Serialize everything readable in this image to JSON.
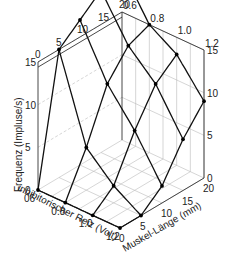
{
  "chart_data": {
    "type": "surface3d",
    "title": "",
    "axes": {
      "z": {
        "label": "Frequenz (Impluse/s)",
        "ticks": [
          0,
          5,
          10,
          15
        ],
        "range": [
          0,
          15
        ]
      },
      "x": {
        "label": "inhibitorischer Reiz (Volt)",
        "ticks": [
          "0.6",
          "0.8",
          "1.0",
          "1.2"
        ],
        "tick_labels": [
          "06",
          "0.8",
          "1.0",
          "1.2"
        ],
        "range": [
          0.6,
          1.2
        ]
      },
      "y": {
        "label": "Muskel-Länge (mm)",
        "ticks": [
          0,
          5,
          10,
          15,
          20
        ],
        "range": [
          0,
          20
        ]
      }
    },
    "back_tick_labels": {
      "top_left_edge": [
        "0",
        "5",
        "10",
        "15",
        "20"
      ],
      "top_right_edge": [
        "0.6",
        "0.8",
        "1.0",
        "1.2"
      ],
      "right_wall_z": [
        "0",
        "5",
        "10",
        "15"
      ]
    },
    "inhibition_levels": [
      "0.6",
      "0.8",
      "1.0",
      "1.2"
    ],
    "muscle_lengths": [
      0,
      5,
      10,
      15,
      20
    ],
    "series": [
      {
        "name": "0.6 V",
        "values": [
          0,
          15,
          17,
          19,
          20
        ]
      },
      {
        "name": "0.8 V",
        "values": [
          0,
          5,
          11,
          14,
          15
        ]
      },
      {
        "name": "1.0 V",
        "values": [
          0,
          2,
          7,
          11,
          13
        ]
      },
      {
        "name": "1.2 V",
        "values": [
          0,
          0,
          2,
          6,
          9
        ]
      }
    ],
    "grid": true,
    "legend": "none"
  }
}
